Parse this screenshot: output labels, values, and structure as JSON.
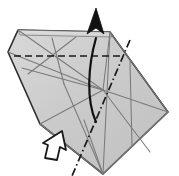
{
  "figure": {
    "title": "Origami fold step diagram",
    "type": "origami-diagram",
    "canvas": {
      "width": 179,
      "height": 176
    },
    "background_color": "#ffffff"
  },
  "colors": {
    "paper_fill": "#c9c9c9",
    "paper_fill_light": "#d6d6d6",
    "paper_fill_dark": "#bcbcbc",
    "outline": "#2b2b2b",
    "crease_line": "#7a7a7a",
    "valley_dashed": "#1a1a1a",
    "mountain_dashdot": "#1a1a1a",
    "fold_arrow": "#111111",
    "push_arrow_stroke": "#1a1a1a",
    "push_arrow_fill": "#ffffff"
  },
  "shape": {
    "name": "folded-paper-body",
    "outline_points": "18,30 110,32 168,112 103,174 40,124 8,52",
    "top_flap_points": "18,30 110,32 168,112 103,174 40,124 8,52",
    "top_band_points": "18,30 110,32 112,37 20,35"
  },
  "creases": [
    {
      "name": "crease-left-diag-a",
      "d": "M 8,52 L 103,90"
    },
    {
      "name": "crease-left-diag-b",
      "d": "M 18,30 L 103,90"
    },
    {
      "name": "crease-left-vert",
      "d": "M 40,124 L 103,90"
    },
    {
      "name": "crease-left-spur-up",
      "d": "M 52,38 L 64,84"
    },
    {
      "name": "crease-left-spur-down",
      "d": "M 28,74 L 76,37"
    },
    {
      "name": "crease-left-long",
      "d": "M 22,68 L 103,90"
    },
    {
      "name": "crease-center-vert",
      "d": "M 110,32 L 103,174"
    },
    {
      "name": "crease-right-up",
      "d": "M 110,32 L 103,90"
    },
    {
      "name": "crease-right-x1",
      "d": "M 103,90 L 168,112"
    },
    {
      "name": "crease-right-x2",
      "d": "M 110,32 L 168,112"
    },
    {
      "name": "crease-right-x3",
      "d": "M 103,174 L 168,112"
    },
    {
      "name": "crease-right-mid",
      "d": "M 130,62 L 132,146"
    },
    {
      "name": "crease-right-cross",
      "d": "M 103,90 L 150,152"
    },
    {
      "name": "crease-bottom-left",
      "d": "M 40,124 L 103,174"
    },
    {
      "name": "crease-bottom-fan-a",
      "d": "M 64,84 L 103,174"
    },
    {
      "name": "crease-bottom-fan-b",
      "d": "M 84,120 L 103,174"
    }
  ],
  "valley_fold": {
    "name": "valley-fold-dashed-line",
    "style": "dashed",
    "d": "M 14,56 L 122,56"
  },
  "mountain_fold": {
    "name": "mountain-fold-dashdot-line",
    "style": "dash-dot",
    "d": "M 130,40 L 72,176"
  },
  "fold_arrow": {
    "name": "fold-direction-arrow",
    "style": "solid-curved-with-head",
    "path": "M 96,122 C 86,100 88,66 96,38",
    "head_points": "96,8 104,34 96,28 87,34"
  },
  "push_arrow": {
    "name": "push-direction-hollow-arrow",
    "style": "hollow-outline",
    "points": "45,158 48,145 43,143 62,131 66,150 60,147 57,160"
  },
  "labels": {
    "step_number": "",
    "caption": ""
  }
}
